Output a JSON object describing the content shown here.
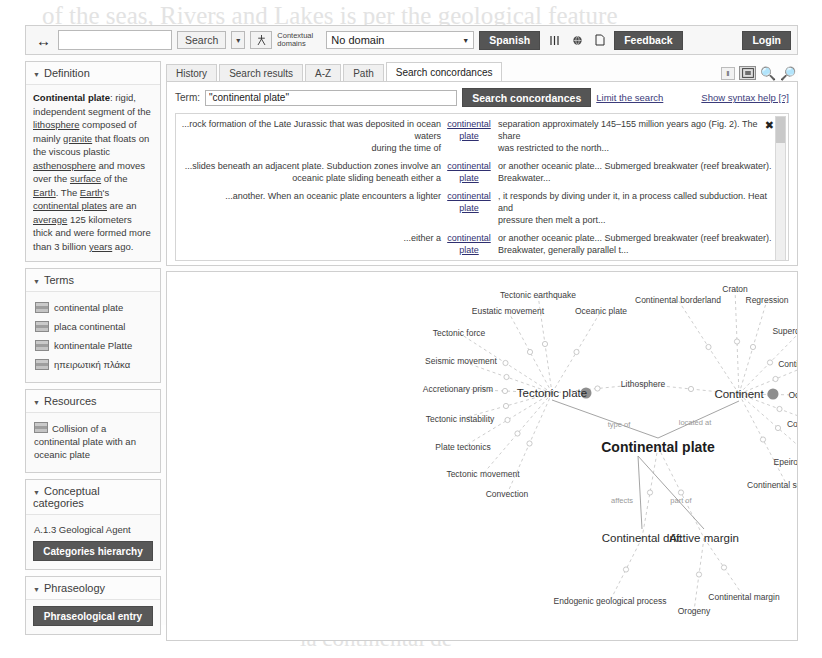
{
  "ghosts": [
    "of the seas, Rivers and Lakes is per the geological feature",
    "and in the colour",
    "a continental",
    "Continental",
    "the gap of the plate",
    "la continental de"
  ],
  "toolbar": {
    "nav_arrows": "↔",
    "search_value": "",
    "search_button": "Search",
    "search_caret": "▾",
    "people_icon": "person-icon",
    "contextual_domains_label": "Contextual domains",
    "domain_value": "No domain",
    "domain_caret": "▼",
    "language_button": "Spanish",
    "columns_icon": "columns-icon",
    "globe_icon": "globe-icon",
    "page_icon": "page-icon",
    "feedback_button": "Feedback",
    "login_button": "Login"
  },
  "sidebar": {
    "definition": {
      "title": "Definition",
      "term": "Continental plate",
      "text_parts": [
        {
          "t": ": rigid, independent segment of the ",
          "u": false
        },
        {
          "t": "lithosphere",
          "u": true
        },
        {
          "t": " composed of mainly ",
          "u": false
        },
        {
          "t": "granite",
          "u": true
        },
        {
          "t": " that floats on the viscous plastic ",
          "u": false
        },
        {
          "t": "asthenosphere",
          "u": true
        },
        {
          "t": " and moves over the ",
          "u": false
        },
        {
          "t": "surface",
          "u": true
        },
        {
          "t": " of the ",
          "u": false
        },
        {
          "t": "Earth",
          "u": true
        },
        {
          "t": ". The ",
          "u": false
        },
        {
          "t": "Earth",
          "u": true
        },
        {
          "t": "'s ",
          "u": false
        },
        {
          "t": "continental plates",
          "u": true
        },
        {
          "t": " are an ",
          "u": false
        },
        {
          "t": "average",
          "u": true
        },
        {
          "t": " 125 kilometers thick and were formed more than 3 billion ",
          "u": false
        },
        {
          "t": "years",
          "u": true
        },
        {
          "t": " ago.",
          "u": false
        }
      ]
    },
    "terms": {
      "title": "Terms",
      "items": [
        {
          "label": "continental plate",
          "flag": "flag-en"
        },
        {
          "label": "placa continental",
          "flag": "flag-es"
        },
        {
          "label": "kontinentale Platte",
          "flag": "flag-de"
        },
        {
          "label": "ηπειρωτική πλάκα",
          "flag": "flag-gr"
        }
      ]
    },
    "resources": {
      "title": "Resources",
      "items": [
        {
          "label": "Collision of a continental plate with an oceanic plate",
          "flag": "flag-en"
        }
      ]
    },
    "conceptual_categories": {
      "title": "Conceptual categories",
      "value": "A.1.3 Geological Agent",
      "button": "Categories hierarchy"
    },
    "phraseology": {
      "title": "Phraseology",
      "button": "Phraseological entry"
    }
  },
  "tabs": [
    {
      "label": "History",
      "active": false
    },
    {
      "label": "Search results",
      "active": false
    },
    {
      "label": "A-Z",
      "active": false
    },
    {
      "label": "Path",
      "active": false
    },
    {
      "label": "Search concordances",
      "active": true
    }
  ],
  "tab_tools": {
    "pin_button": "‖",
    "fit_icon": "fit-to-screen-icon",
    "zoom_in_icon": "zoom-in-icon",
    "zoom_out_icon": "zoom-out-icon"
  },
  "concordances": {
    "term_label": "Term:",
    "term_value": "\"continental plate\"",
    "term_placeholder": "",
    "search_button": "Search concordances",
    "limit_link": "Limit the search",
    "syntax_link": "Show syntax help [?]",
    "close_icon": "✖",
    "rows": [
      {
        "left1": "...rock formation of the Late Jurassic that was deposited in ocean waters",
        "left2": "during the time of",
        "key1": "continental",
        "key2": "plate",
        "right1": "separation approximately 145–155 million years ago (Fig. 2). The share",
        "right2": "was restricted to the north..."
      },
      {
        "left1": "...slides beneath an adjacent plate. Subduction zones involve an",
        "left2": "oceanic plate sliding beneath either a",
        "key1": "continental",
        "key2": "plate",
        "right1": "or another oceanic plate... Submerged breakwater (reef breakwater).",
        "right2": "Breakwater..."
      },
      {
        "left1": "...another. When an oceanic plate encounters a lighter",
        "left2": "",
        "key1": "continental",
        "key2": "plate",
        "right1": ", it responds by diving under it, in a process called subduction. Heat and",
        "right2": "pressure then melt a port..."
      },
      {
        "left1": "...either a",
        "left2": "",
        "key1": "continental",
        "key2": "plate",
        "right1": "or another oceanic plate... Submerged breakwater (reef breakwater).",
        "right2": "Breakwater, generally parallel t..."
      },
      {
        "left1": "...floor to form and spread. Trenches form in a subduction zone, where",
        "left2": "an oceanic plate plunges under a",
        "key1": "continental",
        "key2": "plate",
        "right1": ". 68 Rivers, Lakes, and Oceans range from 4 to 6.8 miles (7 to 11 km)",
        "right2": "deep. Along these areas, a sha..."
      }
    ]
  },
  "concept_map": {
    "nodes": [
      {
        "id": "tectonic-earthquake",
        "label": "Tectonic earthquake",
        "x": 371,
        "y": 23,
        "size": "sm"
      },
      {
        "id": "eustatic-movement",
        "label": "Eustatic movement",
        "x": 341,
        "y": 39,
        "size": "sm"
      },
      {
        "id": "oceanic-plate",
        "label": "Oceanic plate",
        "x": 434,
        "y": 39,
        "size": "sm"
      },
      {
        "id": "tectonic-force",
        "label": "Tectonic force",
        "x": 292,
        "y": 61,
        "size": "sm"
      },
      {
        "id": "seismic-movement",
        "label": "Seismic movement",
        "x": 294,
        "y": 89,
        "size": "sm"
      },
      {
        "id": "accretionary-prism",
        "label": "Accretionary prism",
        "x": 291,
        "y": 117,
        "size": "sm"
      },
      {
        "id": "tectonic-instability",
        "label": "Tectonic instability",
        "x": 293,
        "y": 147,
        "size": "sm"
      },
      {
        "id": "plate-tectonics",
        "label": "Plate tectonics",
        "x": 296,
        "y": 175,
        "size": "sm"
      },
      {
        "id": "tectonic-movement",
        "label": "Tectonic movement",
        "x": 316,
        "y": 202,
        "size": "sm"
      },
      {
        "id": "convection",
        "label": "Convection",
        "x": 340,
        "y": 222,
        "size": "sm"
      },
      {
        "id": "tectonic-plate",
        "label": "Tectonic plate",
        "x": 385,
        "y": 121,
        "size": "mid"
      },
      {
        "id": "lithosphere",
        "label": "Lithosphere",
        "x": 476,
        "y": 112,
        "size": "sm"
      },
      {
        "id": "craton",
        "label": "Craton",
        "x": 568,
        "y": 17,
        "size": "sm"
      },
      {
        "id": "continental-borderland",
        "label": "Continental borderland",
        "x": 511,
        "y": 28,
        "size": "sm"
      },
      {
        "id": "regression",
        "label": "Regression",
        "x": 600,
        "y": 28,
        "size": "sm"
      },
      {
        "id": "supercontinent",
        "label": "Supercontinent",
        "x": 634,
        "y": 59,
        "size": "sm"
      },
      {
        "id": "continental-island",
        "label": "Continental island",
        "x": 645,
        "y": 92,
        "size": "sm"
      },
      {
        "id": "continent",
        "label": "Continent",
        "x": 572,
        "y": 122,
        "size": "mid"
      },
      {
        "id": "ocean",
        "label": "Ocean",
        "x": 634,
        "y": 123,
        "size": "sm"
      },
      {
        "id": "continental-water",
        "label": "Continental water",
        "x": 653,
        "y": 152,
        "size": "sm"
      },
      {
        "id": "epeirogenic-movement",
        "label": "Epeirogenic movement",
        "x": 650,
        "y": 190,
        "size": "sm"
      },
      {
        "id": "continental-sediment",
        "label": "Continental sediment",
        "x": 620,
        "y": 213,
        "size": "sm"
      },
      {
        "id": "continental-plate",
        "label": "Continental plate",
        "x": 491,
        "y": 175,
        "size": "big"
      },
      {
        "id": "continental-drift",
        "label": "Continental drift",
        "x": 475,
        "y": 266,
        "size": "mid"
      },
      {
        "id": "active-margin",
        "label": "Active margin",
        "x": 537,
        "y": 266,
        "size": "mid"
      },
      {
        "id": "endogenic-process",
        "label": "Endogenic geological process",
        "x": 443,
        "y": 329,
        "size": "sm"
      },
      {
        "id": "orogeny",
        "label": "Orogeny",
        "x": 527,
        "y": 339,
        "size": "sm"
      },
      {
        "id": "continental-margin",
        "label": "Continental margin",
        "x": 577,
        "y": 325,
        "size": "sm"
      }
    ],
    "relations": [
      {
        "label": "type of",
        "x": 452,
        "y": 152
      },
      {
        "label": "located at",
        "x": 528,
        "y": 150
      },
      {
        "label": "affects",
        "x": 455,
        "y": 228
      },
      {
        "label": "part of",
        "x": 514,
        "y": 228
      }
    ]
  }
}
